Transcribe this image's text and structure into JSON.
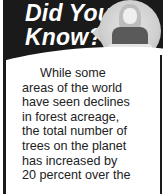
{
  "callout": {
    "title_line1": "Did You",
    "title_line2": "Know?",
    "photo_icon": "person-photo-icon",
    "body_lines": [
      "While some",
      "areas of the world",
      "have seen declines",
      "in forest acreage,",
      "the total number of",
      "trees on the planet",
      "has increased by",
      "20 percent over the"
    ]
  },
  "colors": {
    "header_bg": "#1a1a1a",
    "title_text": "#ffffff",
    "body_text": "#222222"
  }
}
